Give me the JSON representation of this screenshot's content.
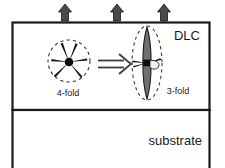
{
  "figure": {
    "type": "schematic-diagram",
    "background_color": "#ffffff",
    "line_color": "#1a1a1a",
    "fill_gray": "#7a7a7a"
  },
  "layers": {
    "film": {
      "label": "DLC",
      "label_x": 196,
      "label_y": 38,
      "box": {
        "x": 12,
        "y": 22,
        "width": 198,
        "height": 88
      }
    },
    "substrate": {
      "label": "substrate",
      "label_x": 180,
      "label_y": 142,
      "box": {
        "x": 12,
        "y": 110,
        "width": 198,
        "height": 58
      }
    }
  },
  "surface_arrows": {
    "name": "stress-arrows",
    "direction": "up",
    "count": 3,
    "x_positions": [
      65,
      117,
      164
    ],
    "tip_y": 5,
    "base_y": 21,
    "color": "#4a4a4a"
  },
  "structures": [
    {
      "id": "four-fold",
      "label": "4-fold",
      "label_x": 68,
      "label_y": 96,
      "shape": "dashed-circle",
      "center_x": 69,
      "center_y": 61,
      "radius": 21
    },
    {
      "id": "three-fold",
      "label": "3-fold",
      "label_x": 178,
      "label_y": 94,
      "shape": "dashed-ellipse",
      "center_x": 147,
      "center_y": 63,
      "rx": 15,
      "ry": 37
    }
  ],
  "transform_arrow": {
    "name": "transformation-arrow",
    "from_x": 98,
    "to_x": 131,
    "y": 64,
    "style": "double-line-open-head"
  }
}
